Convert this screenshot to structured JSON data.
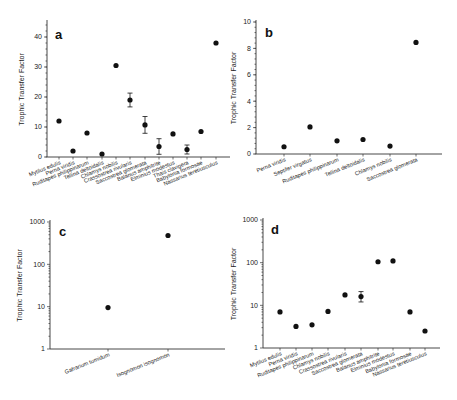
{
  "figure": {
    "background": "#ffffff",
    "marker_color": "#111111"
  },
  "chart_data": [
    {
      "panel": "a",
      "type": "scatter",
      "title": "",
      "xlabel": "",
      "ylabel": "Trophic Transfer Factor",
      "yscale": "linear",
      "ylim": [
        0,
        45
      ],
      "yticks": [
        0,
        10,
        20,
        30,
        40
      ],
      "grid": false,
      "categories": [
        "Mytilus edulis",
        "Perna viridis",
        "Ruditapes philippinarum",
        "Tellina deltoidalis",
        "Chlamys nobilis",
        "Crassostrea rivularis",
        "Saccostrea glomerata",
        "Balanus amphitrite",
        "Elminius modestus",
        "Thais clavigera",
        "Babylonia formosae",
        "Nassarius teretiusculus"
      ],
      "values": [
        12,
        2,
        8,
        1,
        30.5,
        19,
        10.7,
        3.5,
        7.7,
        2.5,
        8.5,
        38
      ],
      "error": [
        null,
        null,
        null,
        null,
        null,
        2.3,
        2.8,
        2.6,
        null,
        1.5,
        null,
        null
      ]
    },
    {
      "panel": "b",
      "type": "scatter",
      "title": "",
      "xlabel": "",
      "ylabel": "Trophic Transfer Factor",
      "yscale": "linear",
      "ylim": [
        0,
        10
      ],
      "yticks": [
        0,
        2,
        4,
        6,
        8,
        10
      ],
      "grid": false,
      "categories": [
        "Perna viridis",
        "Septifer virgatus",
        "Ruditapes philippinarum",
        "Tellina deltoidalis",
        "Chlamys nobilis",
        "Saccostrea glomerata"
      ],
      "values": [
        0.55,
        2.05,
        1.0,
        1.1,
        0.6,
        8.45
      ],
      "error": [
        null,
        null,
        null,
        null,
        null,
        null
      ]
    },
    {
      "panel": "c",
      "type": "scatter",
      "title": "",
      "xlabel": "",
      "ylabel": "Trophic Transfer Factor",
      "yscale": "log",
      "ylim": [
        1,
        1000
      ],
      "yticks": [
        1,
        10,
        100,
        1000
      ],
      "grid": false,
      "categories": [
        "Gafrarium tumidum",
        "Isognomon isognomon"
      ],
      "values": [
        9.5,
        480
      ],
      "error": [
        null,
        null
      ]
    },
    {
      "panel": "d",
      "type": "scatter",
      "title": "",
      "xlabel": "",
      "ylabel": "Trophic Transfer Factor",
      "yscale": "log",
      "ylim": [
        1,
        1000
      ],
      "yticks": [
        1,
        10,
        100,
        1000
      ],
      "grid": false,
      "categories": [
        "Mytilus edulis",
        "Perna viridis",
        "Ruditapes philippinarum",
        "Chlamys nobilis",
        "Crassostrea rivularis",
        "Saccostrea glomerata",
        "Balanus amphitrite",
        "Elminius modestus",
        "Babylonia formosae",
        "Nassarius teretiusculus"
      ],
      "values": [
        7,
        3.2,
        3.5,
        7.2,
        17.5,
        16,
        105,
        110,
        7,
        2.5
      ],
      "error": [
        null,
        null,
        null,
        null,
        null,
        [
          12,
          21
        ],
        null,
        null,
        null,
        null
      ]
    }
  ],
  "layout": [
    {
      "x0": 47,
      "x1": 230,
      "yTop": 22,
      "yBottom": 157,
      "pts_x": [
        59,
        73,
        87,
        102,
        116,
        130,
        145,
        159,
        173,
        187,
        201,
        216
      ],
      "letter_x": 55,
      "letter_y": 39,
      "ylabel_x": 24
    },
    {
      "x0": 256,
      "x1": 442,
      "yTop": 22,
      "yBottom": 154,
      "pts_x": [
        284,
        310,
        337,
        363,
        390,
        416
      ],
      "letter_x": 265,
      "letter_y": 37,
      "ylabel_x": 236
    },
    {
      "x0": 50,
      "x1": 225,
      "yTop": 222,
      "yBottom": 349,
      "pts_x": [
        108,
        168
      ],
      "letter_x": 59,
      "letter_y": 236,
      "ylabel_x": 22
    },
    {
      "x0": 263,
      "x1": 440,
      "yTop": 220,
      "yBottom": 348,
      "pts_x": [
        280,
        296,
        312,
        328,
        345,
        361,
        378,
        393,
        410,
        425
      ],
      "letter_x": 271,
      "letter_y": 234,
      "ylabel_x": 236
    }
  ]
}
